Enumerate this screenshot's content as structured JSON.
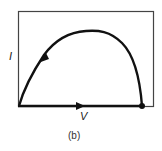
{
  "figure": {
    "caption": "(b)",
    "y_axis_label": "I",
    "x_axis_label": "V",
    "colors": {
      "line": "#111111",
      "frame": "#444444",
      "background": "#ffffff"
    },
    "elements": {
      "frame": "rectangular-box",
      "curve": "arch-shaped I-V trajectory from right dot up over peak and down to origin",
      "arrows": [
        "down-left-on-left-branch",
        "right-on-baseline"
      ],
      "endpoint": "filled-dot-at-right-on-baseline"
    }
  }
}
